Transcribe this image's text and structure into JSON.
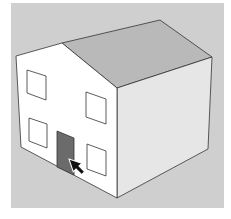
{
  "scene": {
    "description": "3D house model with gable roof, windows and a selected door; cursor pointing at door",
    "colors": {
      "page_bg": "#ffffff",
      "viewport_bg": "#cfcfcf",
      "front_wall": "#ffffff",
      "side_wall": "#e6e6e6",
      "roof": "#b9b9b9",
      "door": "#6b6b6b",
      "edge": "#333333",
      "cursor": "#111111"
    },
    "cursor": {
      "icon": "select-arrow-icon"
    }
  }
}
